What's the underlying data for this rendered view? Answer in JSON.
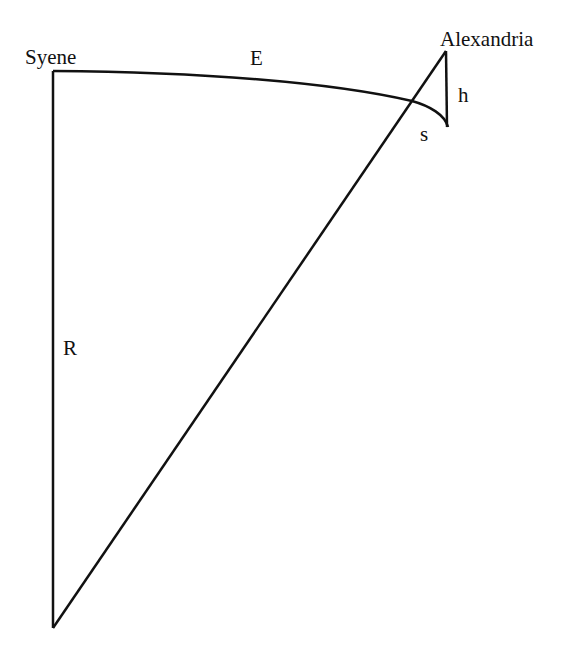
{
  "diagram": {
    "labels": {
      "syene": "Syene",
      "alexandria": "Alexandria",
      "arc": "E",
      "radius": "R",
      "height": "h",
      "shadow": "s"
    },
    "stroke_color": "#111111",
    "background": "#ffffff"
  }
}
